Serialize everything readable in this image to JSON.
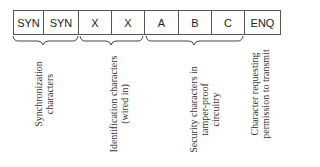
{
  "cells": [
    {
      "label": "SYN",
      "width": 30
    },
    {
      "label": "SYN",
      "width": 35
    },
    {
      "label": "X",
      "width": 33
    },
    {
      "label": "X",
      "width": 33
    },
    {
      "label": "A",
      "width": 34
    },
    {
      "label": "B",
      "width": 33
    },
    {
      "label": "C",
      "width": 33
    },
    {
      "label": "ENQ",
      "width": 35
    }
  ],
  "groups": [
    {
      "line1": "Synchronization",
      "line2": "characters"
    },
    {
      "line1": "Identification characters",
      "line2": "(wired in)"
    },
    {
      "line1": "Security characters in",
      "line2": "tamper-proof",
      "line3": "circuitry"
    },
    {
      "line1": "Character requesting",
      "line2": "permission to transmit"
    }
  ]
}
